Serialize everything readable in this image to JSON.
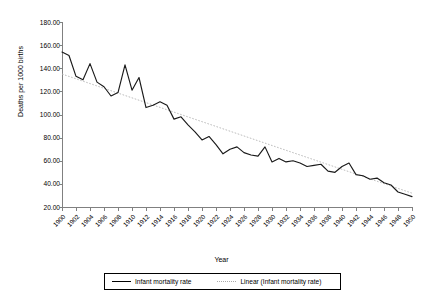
{
  "chart_data": {
    "type": "line",
    "title": "",
    "xlabel": "Year",
    "ylabel": "Deaths per 1000 births",
    "xlim": [
      1900,
      1950
    ],
    "ylim": [
      20,
      180
    ],
    "ytick_labels": [
      "180.00",
      "160.00",
      "140.00",
      "120.00",
      "100.00",
      "80.00",
      "60.00",
      "40.00",
      "20.00"
    ],
    "ytick_values": [
      180,
      160,
      140,
      120,
      100,
      80,
      60,
      40,
      20
    ],
    "xtick_labels": [
      "1900",
      "1902",
      "1904",
      "1906",
      "1908",
      "1910",
      "1912",
      "1914",
      "1916",
      "1918",
      "1920",
      "1922",
      "1924",
      "1926",
      "1928",
      "1930",
      "1932",
      "1934",
      "1936",
      "1938",
      "1940",
      "1942",
      "1944",
      "1946",
      "1948",
      "1950"
    ],
    "xtick_values": [
      1900,
      1902,
      1904,
      1906,
      1908,
      1910,
      1912,
      1914,
      1916,
      1918,
      1920,
      1922,
      1924,
      1926,
      1928,
      1930,
      1932,
      1934,
      1936,
      1938,
      1940,
      1942,
      1944,
      1946,
      1948,
      1950
    ],
    "grid": false,
    "legend_position": "bottom",
    "x": [
      1900,
      1901,
      1902,
      1903,
      1904,
      1905,
      1906,
      1907,
      1908,
      1909,
      1910,
      1911,
      1912,
      1913,
      1914,
      1915,
      1916,
      1917,
      1918,
      1919,
      1920,
      1921,
      1922,
      1923,
      1924,
      1925,
      1926,
      1927,
      1928,
      1929,
      1930,
      1931,
      1932,
      1933,
      1934,
      1935,
      1936,
      1937,
      1938,
      1939,
      1940,
      1941,
      1942,
      1943,
      1944,
      1945,
      1946,
      1947,
      1948,
      1949,
      1950
    ],
    "series": [
      {
        "name": "Infant mortality rate",
        "style": "solid",
        "color": "#1a1a1a",
        "values": [
          154,
          151,
          133,
          130,
          144,
          128,
          124,
          116,
          119,
          143,
          121,
          132,
          106,
          108,
          111,
          108,
          96,
          98,
          91,
          85,
          78,
          81,
          74,
          66,
          70,
          72,
          67,
          65,
          64,
          72,
          59,
          62,
          59,
          60,
          58,
          55,
          56,
          57,
          51,
          50,
          55,
          58,
          48,
          47,
          44,
          45,
          41,
          39,
          33,
          31,
          29
        ]
      },
      {
        "name": "Linear (Infant mortality rate)",
        "style": "dotted",
        "color": "#b4b4b4",
        "trend_start": 135,
        "trend_end": 32
      }
    ]
  },
  "legend": {
    "entries": [
      {
        "label": "Infant mortality rate",
        "style": "solid"
      },
      {
        "label": "Linear (Infant mortality rate)",
        "style": "dotted"
      }
    ]
  }
}
